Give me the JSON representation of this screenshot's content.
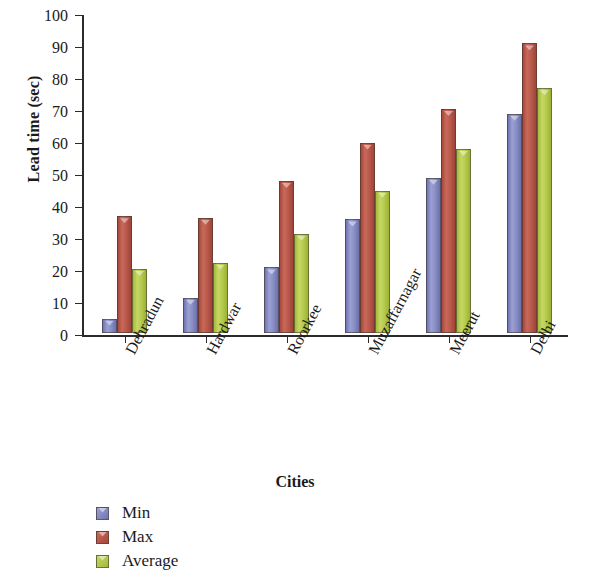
{
  "chart_data": {
    "type": "bar",
    "title": "",
    "xlabel": "Cities",
    "ylabel": "Lead time (sec)",
    "categories": [
      "Dehradun",
      "Hardwar",
      "Roorkee",
      "Muzaffarnagar",
      "Meerut",
      "Delhi"
    ],
    "series": [
      {
        "name": "Min",
        "color": "#8a90c6",
        "values": [
          4.5,
          11,
          20.5,
          35.5,
          48.5,
          68.5
        ]
      },
      {
        "name": "Max",
        "color": "#ba5a4c",
        "values": [
          36.5,
          36,
          47.5,
          59.5,
          70,
          90.5
        ]
      },
      {
        "name": "Average",
        "color": "#b6cc4e",
        "values": [
          20,
          22,
          31,
          44.5,
          57.5,
          76.5
        ]
      }
    ],
    "ylim": [
      0,
      100
    ],
    "yticks": [
      0,
      10,
      20,
      30,
      40,
      50,
      60,
      70,
      80,
      90,
      100
    ],
    "ytick_labels": [
      "0",
      "10",
      "20",
      "30",
      "40",
      "50",
      "60",
      "70",
      "80",
      "90",
      "100"
    ],
    "grid": false,
    "legend_position": "bottom-left",
    "xtick_label_rotation": 62
  }
}
